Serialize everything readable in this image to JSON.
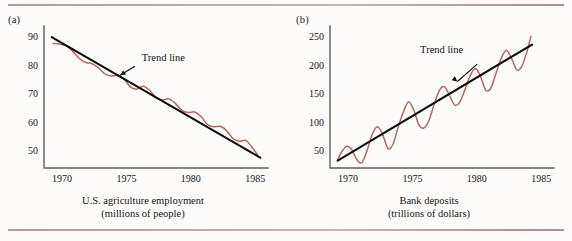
{
  "figure": {
    "background_color": "#fdfcfb",
    "rule_color": "#b89a9d",
    "trend_color": "#0d0d0d",
    "series_color": "#b06a62",
    "axis_color": "#5d5d5d"
  },
  "panels": [
    {
      "tag": "(a)",
      "caption_line1": "U.S. agriculture employment",
      "caption_line2": "(millions of people)",
      "annotation": "Trend line"
    },
    {
      "tag": "(b)",
      "caption_line1": "Bank deposits",
      "caption_line2": "(trillions of dollars)",
      "annotation": "Trend line"
    }
  ],
  "chart_data": [
    {
      "type": "line",
      "title": "U.S. agriculture employment",
      "subtitle": "(millions of people)",
      "panel_tag": "(a)",
      "xlabel": "",
      "ylabel": "millions of people",
      "xlim": [
        1968.6,
        1986.0
      ],
      "ylim": [
        44,
        93
      ],
      "xticks": [
        1970,
        1975,
        1980,
        1985
      ],
      "yticks": [
        50,
        60,
        70,
        80,
        90
      ],
      "grid": false,
      "legend": "none",
      "annotations": [
        {
          "text": "Trend line",
          "x": 1976.2,
          "y": 81.5,
          "points_to_x": 1974.2,
          "points_to_y": 75.5
        }
      ],
      "series": [
        {
          "name": "Trend line",
          "style": "straight-black",
          "x": [
            1969.2,
            1985.4
          ],
          "values": [
            89.8,
            47.6
          ]
        },
        {
          "name": "U.S. agriculture employment",
          "style": "wavy-rose",
          "x": [
            1969.3,
            1969.8,
            1970.3,
            1970.8,
            1971.3,
            1971.8,
            1972.3,
            1972.8,
            1973.3,
            1973.8,
            1974.3,
            1974.8,
            1975.3,
            1975.8,
            1976.3,
            1976.8,
            1977.3,
            1977.8,
            1978.3,
            1978.8,
            1979.3,
            1979.8,
            1980.3,
            1980.8,
            1981.3,
            1981.8,
            1982.3,
            1982.8,
            1983.3,
            1983.8,
            1984.3,
            1984.8,
            1985.2
          ],
          "values": [
            87.6,
            87.4,
            86.8,
            85.0,
            82.5,
            81.0,
            80.6,
            79.2,
            77.0,
            76.2,
            76.4,
            75.2,
            72.4,
            71.6,
            72.6,
            71.2,
            68.6,
            67.8,
            68.2,
            66.6,
            64.2,
            63.4,
            63.6,
            62.0,
            59.2,
            58.4,
            58.6,
            57.0,
            54.2,
            53.4,
            53.6,
            51.0,
            48.6
          ]
        }
      ]
    },
    {
      "type": "line",
      "title": "Bank deposits",
      "subtitle": "(trillions of dollars)",
      "panel_tag": "(b)",
      "xlabel": "",
      "ylabel": "trillions of dollars",
      "xlim": [
        1968.6,
        1986.0
      ],
      "ylim": [
        20,
        265
      ],
      "xticks": [
        1970,
        1975,
        1980,
        1985
      ],
      "yticks": [
        50,
        100,
        150,
        200,
        250
      ],
      "grid": false,
      "legend": "none",
      "annotations": [
        {
          "text": "Trend line",
          "x": 1975.6,
          "y": 222.0,
          "points_to_x": 1978.8,
          "points_to_y": 166.0
        }
      ],
      "series": [
        {
          "name": "Trend line",
          "style": "straight-black",
          "x": [
            1969.2,
            1984.3
          ],
          "values": [
            33.0,
            236.0
          ]
        },
        {
          "name": "Bank deposits",
          "style": "wavy-rose",
          "x": [
            1969.2,
            1969.5,
            1969.9,
            1970.3,
            1970.7,
            1971.1,
            1971.5,
            1971.9,
            1972.3,
            1972.7,
            1973.1,
            1973.5,
            1973.9,
            1974.3,
            1974.7,
            1975.1,
            1975.5,
            1975.9,
            1976.3,
            1976.7,
            1977.1,
            1977.5,
            1977.9,
            1978.3,
            1978.7,
            1979.1,
            1979.5,
            1979.9,
            1980.3,
            1980.7,
            1981.1,
            1981.5,
            1981.9,
            1982.3,
            1982.7,
            1983.1,
            1983.5,
            1983.9,
            1984.2
          ],
          "values": [
            34.0,
            48.0,
            58.0,
            52.0,
            34.0,
            30.0,
            52.0,
            80.0,
            92.0,
            78.0,
            54.0,
            62.0,
            92.0,
            118.0,
            136.0,
            122.0,
            96.0,
            90.0,
            104.0,
            132.0,
            156.0,
            162.0,
            146.0,
            130.0,
            136.0,
            158.0,
            182.0,
            194.0,
            180.0,
            156.0,
            160.0,
            186.0,
            212.0,
            226.0,
            212.0,
            192.0,
            198.0,
            224.0,
            250.0
          ]
        }
      ]
    }
  ]
}
